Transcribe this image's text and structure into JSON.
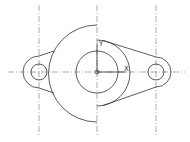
{
  "drawing": {
    "type": "mechanical part outline",
    "axis_labels": {
      "x": "X",
      "y": "Y"
    },
    "line_color": "#333333",
    "background": "#ffffff"
  }
}
